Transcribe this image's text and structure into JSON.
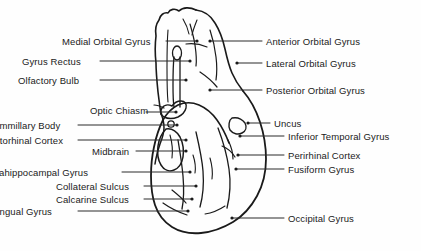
{
  "figure": {
    "ink_color": "#1a1a1a",
    "background_color": "#fefefe"
  },
  "labels_left": [
    {
      "text": "Medial Orbital Gyrus",
      "x": 62,
      "y": 36,
      "clipped": false
    },
    {
      "text": "Gyrus Rectus",
      "x": 22,
      "y": 56,
      "clipped": false
    },
    {
      "text": "Olfactory Bulb",
      "x": 18,
      "y": 75,
      "clipped": false
    },
    {
      "text": "Optic Chiasm",
      "x": 90,
      "y": 105,
      "clipped": false
    },
    {
      "text": "Mammillary Body",
      "x": -14,
      "y": 120,
      "clipped": true
    },
    {
      "text": "Entorhinal Cortex",
      "x": -12,
      "y": 135,
      "clipped": true
    },
    {
      "text": "Midbrain",
      "x": 92,
      "y": 146,
      "clipped": false
    },
    {
      "text": "Parahippocampal Gyrus",
      "x": -16,
      "y": 167,
      "clipped": true
    },
    {
      "text": "Collateral Sulcus",
      "x": 56,
      "y": 181,
      "clipped": false
    },
    {
      "text": "Calcarine Sulcus",
      "x": 56,
      "y": 194,
      "clipped": false
    },
    {
      "text": "Lingual Gyrus",
      "x": -8,
      "y": 206,
      "clipped": true
    }
  ],
  "labels_right": [
    {
      "text": "Anterior Orbital Gyrus",
      "x": 266,
      "y": 36
    },
    {
      "text": "Lateral Orbital Gyrus",
      "x": 266,
      "y": 58
    },
    {
      "text": "Posterior Orbital Gyrus",
      "x": 266,
      "y": 85
    },
    {
      "text": "Uncus",
      "x": 274,
      "y": 118
    },
    {
      "text": "Inferior Temporal Gyrus",
      "x": 288,
      "y": 131
    },
    {
      "text": "Perirhinal Cortex",
      "x": 288,
      "y": 150
    },
    {
      "text": "Fusiform Gyrus",
      "x": 288,
      "y": 164
    },
    {
      "text": "Occipital Gyrus",
      "x": 288,
      "y": 213
    }
  ],
  "leaders_left": [
    {
      "x1": 166,
      "y1": 41,
      "x2": 197,
      "y2": 41
    },
    {
      "x1": 100,
      "y1": 61,
      "x2": 190,
      "y2": 61
    },
    {
      "x1": 100,
      "y1": 80,
      "x2": 186,
      "y2": 80
    },
    {
      "x1": 146,
      "y1": 112,
      "x2": 176,
      "y2": 112
    },
    {
      "x1": 78,
      "y1": 125,
      "x2": 177,
      "y2": 125
    },
    {
      "x1": 78,
      "y1": 140,
      "x2": 186,
      "y2": 140
    },
    {
      "x1": 136,
      "y1": 151,
      "x2": 186,
      "y2": 151
    },
    {
      "x1": 122,
      "y1": 172,
      "x2": 190,
      "y2": 172
    },
    {
      "x1": 144,
      "y1": 186,
      "x2": 196,
      "y2": 186
    },
    {
      "x1": 144,
      "y1": 199,
      "x2": 192,
      "y2": 199
    },
    {
      "x1": 78,
      "y1": 211,
      "x2": 188,
      "y2": 211
    }
  ],
  "leaders_right": [
    {
      "x1": 210,
      "y1": 41,
      "x2": 262,
      "y2": 41
    },
    {
      "x1": 237,
      "y1": 63,
      "x2": 262,
      "y2": 63
    },
    {
      "x1": 210,
      "y1": 90,
      "x2": 262,
      "y2": 90
    },
    {
      "x1": 248,
      "y1": 123,
      "x2": 270,
      "y2": 123
    },
    {
      "x1": 240,
      "y1": 136,
      "x2": 284,
      "y2": 136
    },
    {
      "x1": 238,
      "y1": 155,
      "x2": 284,
      "y2": 155
    },
    {
      "x1": 236,
      "y1": 169,
      "x2": 284,
      "y2": 169
    },
    {
      "x1": 232,
      "y1": 218,
      "x2": 284,
      "y2": 218
    }
  ],
  "leader_dots_left": [
    {
      "x": 197,
      "y": 41
    },
    {
      "x": 190,
      "y": 61
    },
    {
      "x": 186,
      "y": 80
    },
    {
      "x": 176,
      "y": 112
    },
    {
      "x": 177,
      "y": 125
    },
    {
      "x": 186,
      "y": 140
    },
    {
      "x": 186,
      "y": 151
    },
    {
      "x": 190,
      "y": 172
    },
    {
      "x": 196,
      "y": 186
    },
    {
      "x": 192,
      "y": 199
    },
    {
      "x": 188,
      "y": 211
    }
  ],
  "leader_dots_right": [
    {
      "x": 210,
      "y": 41
    },
    {
      "x": 237,
      "y": 63
    },
    {
      "x": 210,
      "y": 90
    },
    {
      "x": 248,
      "y": 123
    },
    {
      "x": 240,
      "y": 136
    },
    {
      "x": 238,
      "y": 155
    },
    {
      "x": 236,
      "y": 169
    },
    {
      "x": 232,
      "y": 218
    }
  ]
}
